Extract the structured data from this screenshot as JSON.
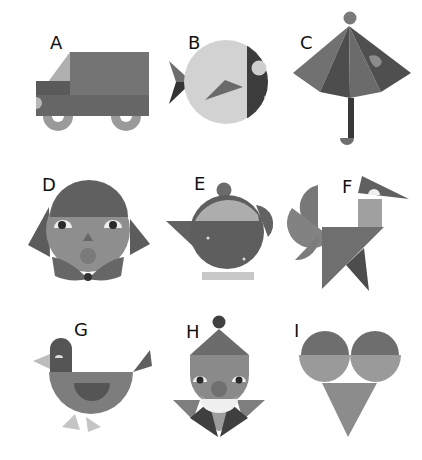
{
  "figures": [
    {
      "label": "A",
      "subject": "truck"
    },
    {
      "label": "B",
      "subject": "fish"
    },
    {
      "label": "C",
      "subject": "umbrella"
    },
    {
      "label": "D",
      "subject": "girl-face"
    },
    {
      "label": "E",
      "subject": "teapot"
    },
    {
      "label": "F",
      "subject": "bird-with-wings"
    },
    {
      "label": "G",
      "subject": "hen"
    },
    {
      "label": "H",
      "subject": "clown"
    },
    {
      "label": "I",
      "subject": "ice-cream-cone"
    }
  ],
  "colors": {
    "background": "#ffffff",
    "label": "#111111",
    "dark": "#3a3a3a",
    "darkmid": "#555555",
    "mid": "#727272",
    "midlight": "#8a8a8a",
    "light": "#a8a8a8",
    "lighter": "#c4c4c4",
    "pale": "#d9d9d9",
    "white": "#f4f4f4"
  }
}
